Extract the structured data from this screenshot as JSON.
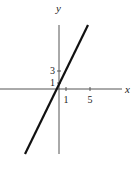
{
  "chart_data": {
    "type": "line",
    "title": "",
    "xlabel": "x",
    "ylabel": "y",
    "series": [
      {
        "name": "y = 2x + 1",
        "x": [
          -6,
          4.5
        ],
        "y": [
          -11,
          10
        ]
      }
    ],
    "x_ticks": [
      {
        "value": 1,
        "label": "1"
      },
      {
        "value": 5,
        "label": "5"
      }
    ],
    "y_ticks": [
      {
        "value": 3,
        "label": "3"
      },
      {
        "value": 1,
        "label": "1"
      }
    ],
    "xlim": [
      -10,
      10
    ],
    "ylim": [
      -11,
      11
    ],
    "grid": false,
    "legend": "none"
  }
}
